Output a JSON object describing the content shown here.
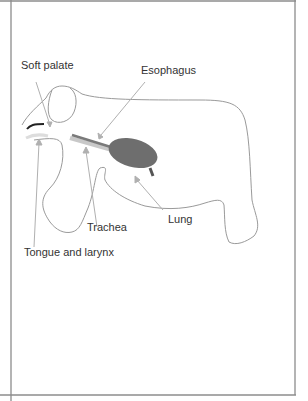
{
  "diagram": {
    "labels": {
      "soft_palate": "Soft palate",
      "esophagus": "Esophagus",
      "trachea": "Trachea",
      "lung": "Lung",
      "tongue_larynx": "Tongue and larynx"
    },
    "colors": {
      "outline": "#9a9a9a",
      "frame": "#8c8c8c",
      "lung_fill": "#6e6e6e",
      "esophagus": "#7a7a7a",
      "trachea": "#c8c8c8",
      "arrow": "#b0b0b0",
      "soft_palate": "#222222"
    }
  }
}
